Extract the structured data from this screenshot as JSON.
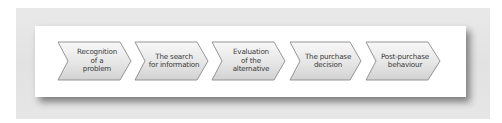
{
  "diagram": {
    "type": "process-flow",
    "shape": "chevron",
    "colors": {
      "outer_panel": "#e4e4e4",
      "card": "#ffffff",
      "chevron_fill_top": "#f7f7f7",
      "chevron_fill_bottom": "#d6d6d6",
      "chevron_stroke": "#8a8a8a",
      "text": "#3a3a3a"
    },
    "steps": [
      {
        "label": "Recognition\nof a\nproblem"
      },
      {
        "label": "The search\nfor information"
      },
      {
        "label": "Evaluation\nof the\nalternative"
      },
      {
        "label": "The purchase\ndecision"
      },
      {
        "label": "Post-purchase\nbehaviour"
      }
    ]
  }
}
